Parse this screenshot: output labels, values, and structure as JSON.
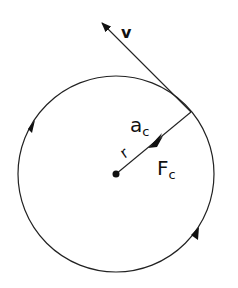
{
  "diagram": {
    "labels": {
      "velocity": "v",
      "acceleration": "a",
      "acceleration_sub": "c",
      "radius": "r",
      "force": "F",
      "force_sub": "c"
    },
    "colors": {
      "stroke": "#222222",
      "background": "#ffffff"
    },
    "geometry": {
      "center": [
        116,
        174
      ],
      "radius": 98,
      "tangent_point": [
        191,
        112
      ],
      "velocity_tip": [
        100,
        21
      ]
    }
  }
}
